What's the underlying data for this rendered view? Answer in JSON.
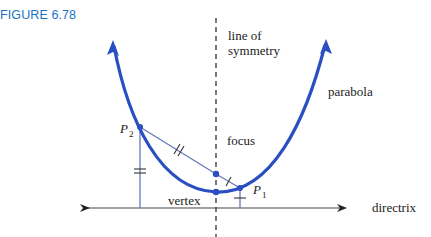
{
  "figure": {
    "label": "FIGURE 6.78",
    "label_color": "#1a73c9"
  },
  "diagram": {
    "labels": {
      "line_of_symmetry_1": "line of",
      "line_of_symmetry_2": "symmetry",
      "parabola": "parabola",
      "focus": "focus",
      "vertex": "vertex",
      "directrix": "directrix",
      "p1": "P",
      "p1_sub": "1",
      "p2": "P",
      "p2_sub": "2"
    },
    "colors": {
      "parabola": "#2a4fc0",
      "segments": "#6678b8",
      "directrix": "#333333",
      "axis": "#333333"
    },
    "points": {
      "vertex": [
        216,
        192
      ],
      "focus": [
        216,
        174
      ],
      "p1": [
        240,
        188
      ],
      "p2": [
        140,
        127
      ]
    }
  }
}
